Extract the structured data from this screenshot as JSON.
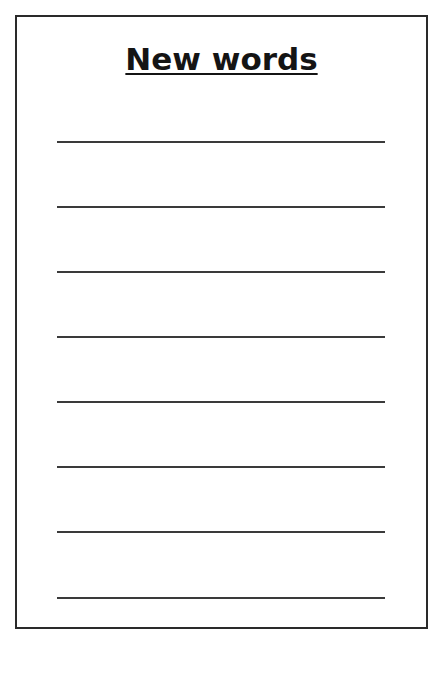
{
  "worksheet": {
    "title": "New words",
    "line_count": 8,
    "colors": {
      "border": "#2a2a2a",
      "lines": "#3a3a3a",
      "title": "#141414",
      "background": "#ffffff"
    }
  }
}
